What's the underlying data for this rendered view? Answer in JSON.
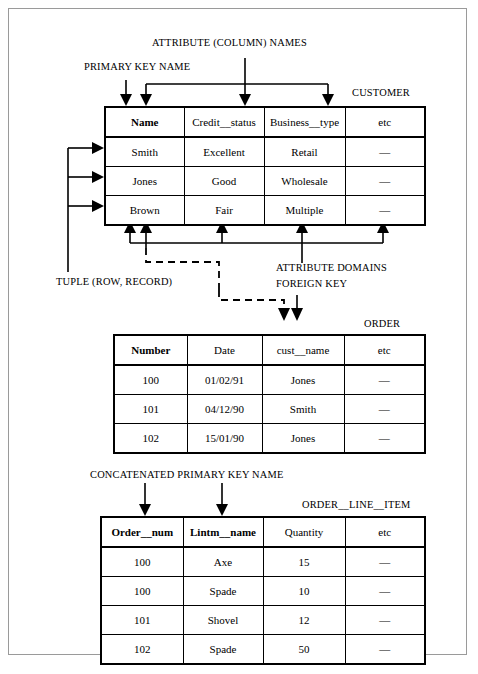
{
  "annotations": {
    "attribute_column_names": "ATTRIBUTE (COLUMN) NAMES",
    "primary_key_name": "PRIMARY KEY NAME",
    "tuple": "TUPLE (ROW, RECORD)",
    "attribute_domains": "ATTRIBUTE DOMAINS",
    "foreign_key": "FOREIGN KEY",
    "concatenated_primary_key_name": "CONCATENATED PRIMARY KEY NAME"
  },
  "tables": [
    {
      "id": "customer",
      "title": "CUSTOMER",
      "columns": [
        "Name",
        "Credit__status",
        "Business__type",
        "etc"
      ],
      "key_columns": [
        0
      ],
      "rows": [
        [
          "Smith",
          "Excellent",
          "Retail",
          "—"
        ],
        [
          "Jones",
          "Good",
          "Wholesale",
          "—"
        ],
        [
          "Brown",
          "Fair",
          "Multiple",
          "—"
        ]
      ]
    },
    {
      "id": "order",
      "title": "ORDER",
      "columns": [
        "Number",
        "Date",
        "cust__name",
        "etc"
      ],
      "key_columns": [
        0
      ],
      "rows": [
        [
          "100",
          "01/02/91",
          "Jones",
          "—"
        ],
        [
          "101",
          "04/12/90",
          "Smith",
          "—"
        ],
        [
          "102",
          "15/01/90",
          "Jones",
          "—"
        ]
      ]
    },
    {
      "id": "order_line_item",
      "title": "ORDER__LINE__ITEM",
      "columns": [
        "Order__num",
        "Lintm__name",
        "Quantity",
        "etc"
      ],
      "key_columns": [
        0,
        1
      ],
      "rows": [
        [
          "100",
          "Axe",
          "15",
          "—"
        ],
        [
          "100",
          "Spade",
          "10",
          "—"
        ],
        [
          "101",
          "Shovel",
          "12",
          "—"
        ],
        [
          "102",
          "Spade",
          "50",
          "—"
        ]
      ]
    }
  ],
  "colors": {
    "ink": "#000000",
    "page_border": "#9a9a9a",
    "background": "#ffffff"
  }
}
